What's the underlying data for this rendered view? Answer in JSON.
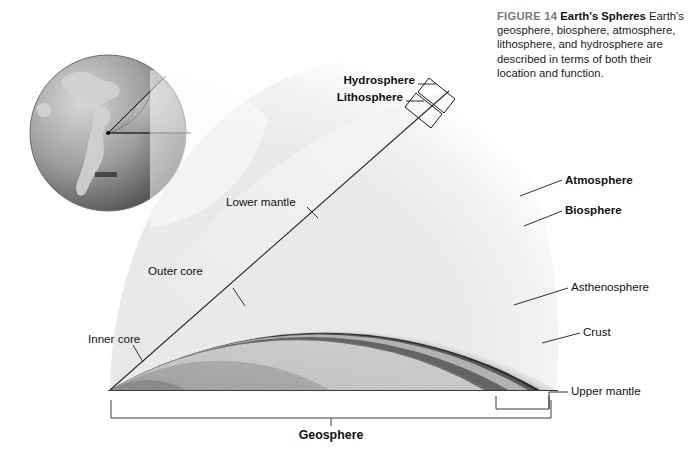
{
  "figure": {
    "number_label": "FIGURE 14",
    "title": "Earth's Spheres",
    "body": "Earth's geosphere, biosphere, atmosphere, lithosphere, and hydrosphere are described in terms of both their location and function."
  },
  "labels": {
    "hydrosphere": "Hydrosphere",
    "lithosphere": "Lithosphere",
    "atmosphere": "Atmosphere",
    "biosphere": "Biosphere",
    "asthenosphere": "Asthenosphere",
    "crust": "Crust",
    "upper_mantle": "Upper mantle",
    "lower_mantle": "Lower mantle",
    "outer_core": "Outer core",
    "inner_core": "Inner core",
    "geosphere": "Geosphere"
  },
  "colors": {
    "background": "#ffffff",
    "figure_number": "#7b7b7b",
    "text": "#111111",
    "leader_line": "#1a1a1a",
    "atmosphere_halo": "#f2f2f2",
    "lower_mantle_cut": "#efefef",
    "lower_mantle_arc": "#c9c9c9",
    "outer_core": "#a9a9a9",
    "inner_core": "#8e8e8e",
    "upper_mantle_band": "#b9b9b9",
    "asthenosphere_band": "#6d6d6d",
    "lithosphere_band": "#4a4a4a",
    "crust_band": "#2b2b2b",
    "globe_land": "#cfcfcf",
    "globe_ocean": "#8c8c8c"
  },
  "diagram": {
    "type": "cutaway-cross-section",
    "geosphere_bracket_label": "Geosphere",
    "layer_order_inward": [
      "Atmosphere",
      "Biosphere",
      "Hydrosphere",
      "Lithosphere",
      "Crust",
      "Upper mantle",
      "Asthenosphere",
      "Lower mantle",
      "Outer core",
      "Inner core"
    ]
  }
}
